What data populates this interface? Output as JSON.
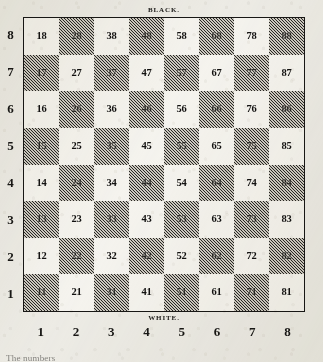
{
  "diagram": {
    "top_caption": "BLACK.",
    "bottom_caption": "WHITE.",
    "page_text_fragment": "The numbers"
  },
  "colors": {
    "paper": "#efeee9",
    "light_square": "#f7f6f2",
    "dark_square": "#cfccc4",
    "hatch_ink": "#1a1917",
    "border": "#181715",
    "text": "#121110"
  },
  "axes": {
    "rank_labels": [
      "8",
      "7",
      "6",
      "5",
      "4",
      "3",
      "2",
      "1"
    ],
    "file_labels": [
      "1",
      "2",
      "3",
      "4",
      "5",
      "6",
      "7",
      "8"
    ]
  },
  "chart_data": {
    "type": "heatmap",
    "title": "BLACK.",
    "subtitle": "WHITE.",
    "xlabel": "",
    "ylabel": "",
    "x": [
      "1",
      "2",
      "3",
      "4",
      "5",
      "6",
      "7",
      "8"
    ],
    "y": [
      "8",
      "7",
      "6",
      "5",
      "4",
      "3",
      "2",
      "1"
    ],
    "grid": true,
    "legend": "none",
    "cells": [
      {
        "label": "18",
        "file": 1,
        "rank": 8,
        "shade": "light"
      },
      {
        "label": "28",
        "file": 2,
        "rank": 8,
        "shade": "dark"
      },
      {
        "label": "38",
        "file": 3,
        "rank": 8,
        "shade": "light"
      },
      {
        "label": "48",
        "file": 4,
        "rank": 8,
        "shade": "dark"
      },
      {
        "label": "58",
        "file": 5,
        "rank": 8,
        "shade": "light"
      },
      {
        "label": "68",
        "file": 6,
        "rank": 8,
        "shade": "dark"
      },
      {
        "label": "78",
        "file": 7,
        "rank": 8,
        "shade": "light"
      },
      {
        "label": "88",
        "file": 8,
        "rank": 8,
        "shade": "dark"
      },
      {
        "label": "17",
        "file": 1,
        "rank": 7,
        "shade": "dark"
      },
      {
        "label": "27",
        "file": 2,
        "rank": 7,
        "shade": "light"
      },
      {
        "label": "37",
        "file": 3,
        "rank": 7,
        "shade": "dark"
      },
      {
        "label": "47",
        "file": 4,
        "rank": 7,
        "shade": "light"
      },
      {
        "label": "57",
        "file": 5,
        "rank": 7,
        "shade": "dark"
      },
      {
        "label": "67",
        "file": 6,
        "rank": 7,
        "shade": "light"
      },
      {
        "label": "77",
        "file": 7,
        "rank": 7,
        "shade": "dark"
      },
      {
        "label": "87",
        "file": 8,
        "rank": 7,
        "shade": "light"
      },
      {
        "label": "16",
        "file": 1,
        "rank": 6,
        "shade": "light"
      },
      {
        "label": "26",
        "file": 2,
        "rank": 6,
        "shade": "dark"
      },
      {
        "label": "36",
        "file": 3,
        "rank": 6,
        "shade": "light"
      },
      {
        "label": "46",
        "file": 4,
        "rank": 6,
        "shade": "dark"
      },
      {
        "label": "56",
        "file": 5,
        "rank": 6,
        "shade": "light"
      },
      {
        "label": "66",
        "file": 6,
        "rank": 6,
        "shade": "dark"
      },
      {
        "label": "76",
        "file": 7,
        "rank": 6,
        "shade": "light"
      },
      {
        "label": "86",
        "file": 8,
        "rank": 6,
        "shade": "dark"
      },
      {
        "label": "15",
        "file": 1,
        "rank": 5,
        "shade": "dark"
      },
      {
        "label": "25",
        "file": 2,
        "rank": 5,
        "shade": "light"
      },
      {
        "label": "35",
        "file": 3,
        "rank": 5,
        "shade": "dark"
      },
      {
        "label": "45",
        "file": 4,
        "rank": 5,
        "shade": "light"
      },
      {
        "label": "55",
        "file": 5,
        "rank": 5,
        "shade": "dark"
      },
      {
        "label": "65",
        "file": 6,
        "rank": 5,
        "shade": "light"
      },
      {
        "label": "75",
        "file": 7,
        "rank": 5,
        "shade": "dark"
      },
      {
        "label": "85",
        "file": 8,
        "rank": 5,
        "shade": "light"
      },
      {
        "label": "14",
        "file": 1,
        "rank": 4,
        "shade": "light"
      },
      {
        "label": "24",
        "file": 2,
        "rank": 4,
        "shade": "dark"
      },
      {
        "label": "34",
        "file": 3,
        "rank": 4,
        "shade": "light"
      },
      {
        "label": "44",
        "file": 4,
        "rank": 4,
        "shade": "dark"
      },
      {
        "label": "54",
        "file": 5,
        "rank": 4,
        "shade": "light"
      },
      {
        "label": "64",
        "file": 6,
        "rank": 4,
        "shade": "dark"
      },
      {
        "label": "74",
        "file": 7,
        "rank": 4,
        "shade": "light"
      },
      {
        "label": "84",
        "file": 8,
        "rank": 4,
        "shade": "dark"
      },
      {
        "label": "13",
        "file": 1,
        "rank": 3,
        "shade": "dark"
      },
      {
        "label": "23",
        "file": 2,
        "rank": 3,
        "shade": "light"
      },
      {
        "label": "33",
        "file": 3,
        "rank": 3,
        "shade": "dark"
      },
      {
        "label": "43",
        "file": 4,
        "rank": 3,
        "shade": "light"
      },
      {
        "label": "53",
        "file": 5,
        "rank": 3,
        "shade": "dark"
      },
      {
        "label": "63",
        "file": 6,
        "rank": 3,
        "shade": "light"
      },
      {
        "label": "73",
        "file": 7,
        "rank": 3,
        "shade": "dark"
      },
      {
        "label": "83",
        "file": 8,
        "rank": 3,
        "shade": "light"
      },
      {
        "label": "12",
        "file": 1,
        "rank": 2,
        "shade": "light"
      },
      {
        "label": "22",
        "file": 2,
        "rank": 2,
        "shade": "dark"
      },
      {
        "label": "32",
        "file": 3,
        "rank": 2,
        "shade": "light"
      },
      {
        "label": "42",
        "file": 4,
        "rank": 2,
        "shade": "dark"
      },
      {
        "label": "52",
        "file": 5,
        "rank": 2,
        "shade": "light"
      },
      {
        "label": "62",
        "file": 6,
        "rank": 2,
        "shade": "dark"
      },
      {
        "label": "72",
        "file": 7,
        "rank": 2,
        "shade": "light"
      },
      {
        "label": "82",
        "file": 8,
        "rank": 2,
        "shade": "dark"
      },
      {
        "label": "11",
        "file": 1,
        "rank": 1,
        "shade": "dark"
      },
      {
        "label": "21",
        "file": 2,
        "rank": 1,
        "shade": "light"
      },
      {
        "label": "31",
        "file": 3,
        "rank": 1,
        "shade": "dark"
      },
      {
        "label": "41",
        "file": 4,
        "rank": 1,
        "shade": "light"
      },
      {
        "label": "51",
        "file": 5,
        "rank": 1,
        "shade": "dark"
      },
      {
        "label": "61",
        "file": 6,
        "rank": 1,
        "shade": "light"
      },
      {
        "label": "71",
        "file": 7,
        "rank": 1,
        "shade": "dark"
      },
      {
        "label": "81",
        "file": 8,
        "rank": 1,
        "shade": "light"
      }
    ]
  }
}
